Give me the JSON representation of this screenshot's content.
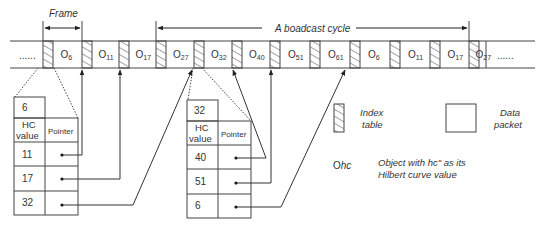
{
  "diagram": {
    "frame_label": "Frame",
    "cycle_label": "A boadcast cycle",
    "strip": {
      "ellipsis_left": "......",
      "ellipsis_right": "......",
      "packets": [
        {
          "base": "O",
          "sub": "6"
        },
        {
          "base": "O",
          "sub": "11"
        },
        {
          "base": "O",
          "sub": "17"
        },
        {
          "base": "O",
          "sub": "27"
        },
        {
          "base": "O",
          "sub": "32"
        },
        {
          "base": "O",
          "sub": "40"
        },
        {
          "base": "O",
          "sub": "51"
        },
        {
          "base": "O",
          "sub": "61"
        },
        {
          "base": "O",
          "sub": "6"
        },
        {
          "base": "O",
          "sub": "11"
        },
        {
          "base": "O",
          "sub": "17"
        },
        {
          "base": "O",
          "sub": "27"
        }
      ]
    },
    "index_tables": [
      {
        "key": "6",
        "col_hc": [
          "HC",
          "value"
        ],
        "col_pointer": "Pointer",
        "rows": [
          "11",
          "17",
          "32"
        ]
      },
      {
        "key": "32",
        "col_hc": [
          "HC",
          "value"
        ],
        "col_pointer": "Pointer",
        "rows": [
          "40",
          "51",
          "6"
        ]
      }
    ],
    "legend": {
      "index_table": [
        "Index",
        "table"
      ],
      "data_packet": [
        "Data",
        "packet"
      ],
      "object_symbol": "O",
      "object_symbol_sub": "hc",
      "object_desc": [
        "Object with hc\" as its",
        "Hilbert curve value"
      ]
    },
    "colors": {
      "line": "#333333",
      "hatch": "#555555",
      "background": "#ffffff"
    }
  }
}
